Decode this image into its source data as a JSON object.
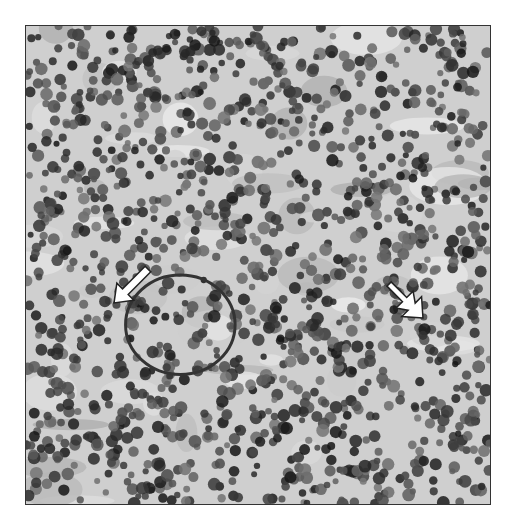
{
  "figure": {
    "palette": {
      "background": "#ffffff",
      "stroma": "#cfcfcf",
      "nucleus_dark": "#1e1e1e",
      "nucleus_mid": "#5a5a5a",
      "arrow_fill": "#ffffff",
      "arrow_stroke": "#222222"
    },
    "arrows": [
      {
        "name": "arrow-left",
        "style": "single-head",
        "x": 100,
        "y": 255,
        "angle": 45
      },
      {
        "name": "arrow-right",
        "style": "double-head",
        "x": 380,
        "y": 268,
        "angle": 45
      }
    ]
  }
}
